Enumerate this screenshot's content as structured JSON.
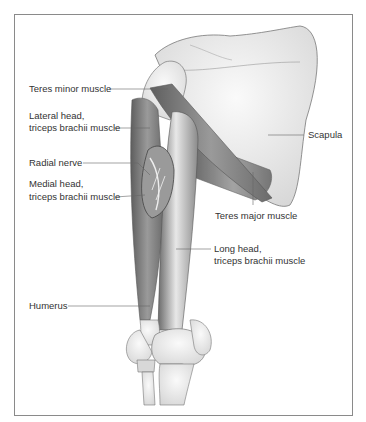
{
  "figure": {
    "labels": {
      "teres_minor": "Teres minor muscle",
      "lateral_head_1": "Lateral head,",
      "lateral_head_2": "triceps brachii muscle",
      "radial_nerve": "Radial nerve",
      "medial_head_1": "Medial head,",
      "medial_head_2": "triceps brachii muscle",
      "humerus": "Humerus",
      "scapula": "Scapula",
      "teres_major": "Teres major muscle",
      "long_head_1": "Long head,",
      "long_head_2": "triceps brachii muscle"
    },
    "colors": {
      "frame": "#8a8a8a",
      "leader": "#666666",
      "bone": "#ececec",
      "muscle": "#7a7a7a",
      "text": "#333333"
    }
  }
}
